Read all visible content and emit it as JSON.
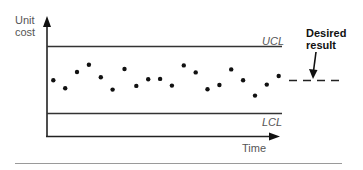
{
  "chart_data": {
    "type": "scatter",
    "title": "",
    "ylabel": "Unit cost",
    "xlabel": "Time",
    "ylabel_lines": [
      "Unit",
      "cost"
    ],
    "control_limits": {
      "UCL": 100,
      "LCL": 0,
      "ucl_label": "UCL",
      "lcl_label": "LCL"
    },
    "x": [
      1,
      2,
      3,
      4,
      5,
      6,
      7,
      8,
      9,
      10,
      11,
      12,
      13,
      14,
      15,
      16,
      17,
      18,
      19,
      20
    ],
    "values": [
      49.5,
      37.6,
      62.0,
      72.8,
      54.0,
      35.7,
      66.4,
      41.2,
      51.0,
      51.6,
      41.6,
      71.8,
      61.4,
      36.1,
      42.6,
      65.8,
      49.5,
      26.7,
      43.1,
      56.0
    ],
    "desired_result": {
      "value": 49.5,
      "style": "dashed",
      "label_lines": [
        "Desired",
        "result"
      ]
    },
    "ylim": [
      -35,
      150
    ],
    "grid": false,
    "legend": null,
    "note": "values normalized so LCL=0 and UCL=100; axes have no numeric ticks"
  },
  "labels": {
    "y_line1": "Unit",
    "y_line2": "cost",
    "ucl": "UCL",
    "lcl": "LCL",
    "x_axis": "Time",
    "desired_line1": "Desired",
    "desired_line2": "result"
  },
  "colors": {
    "axis": "#222222",
    "points": "#111111",
    "label_text": "#555555",
    "rule": "#9a9a9a"
  }
}
